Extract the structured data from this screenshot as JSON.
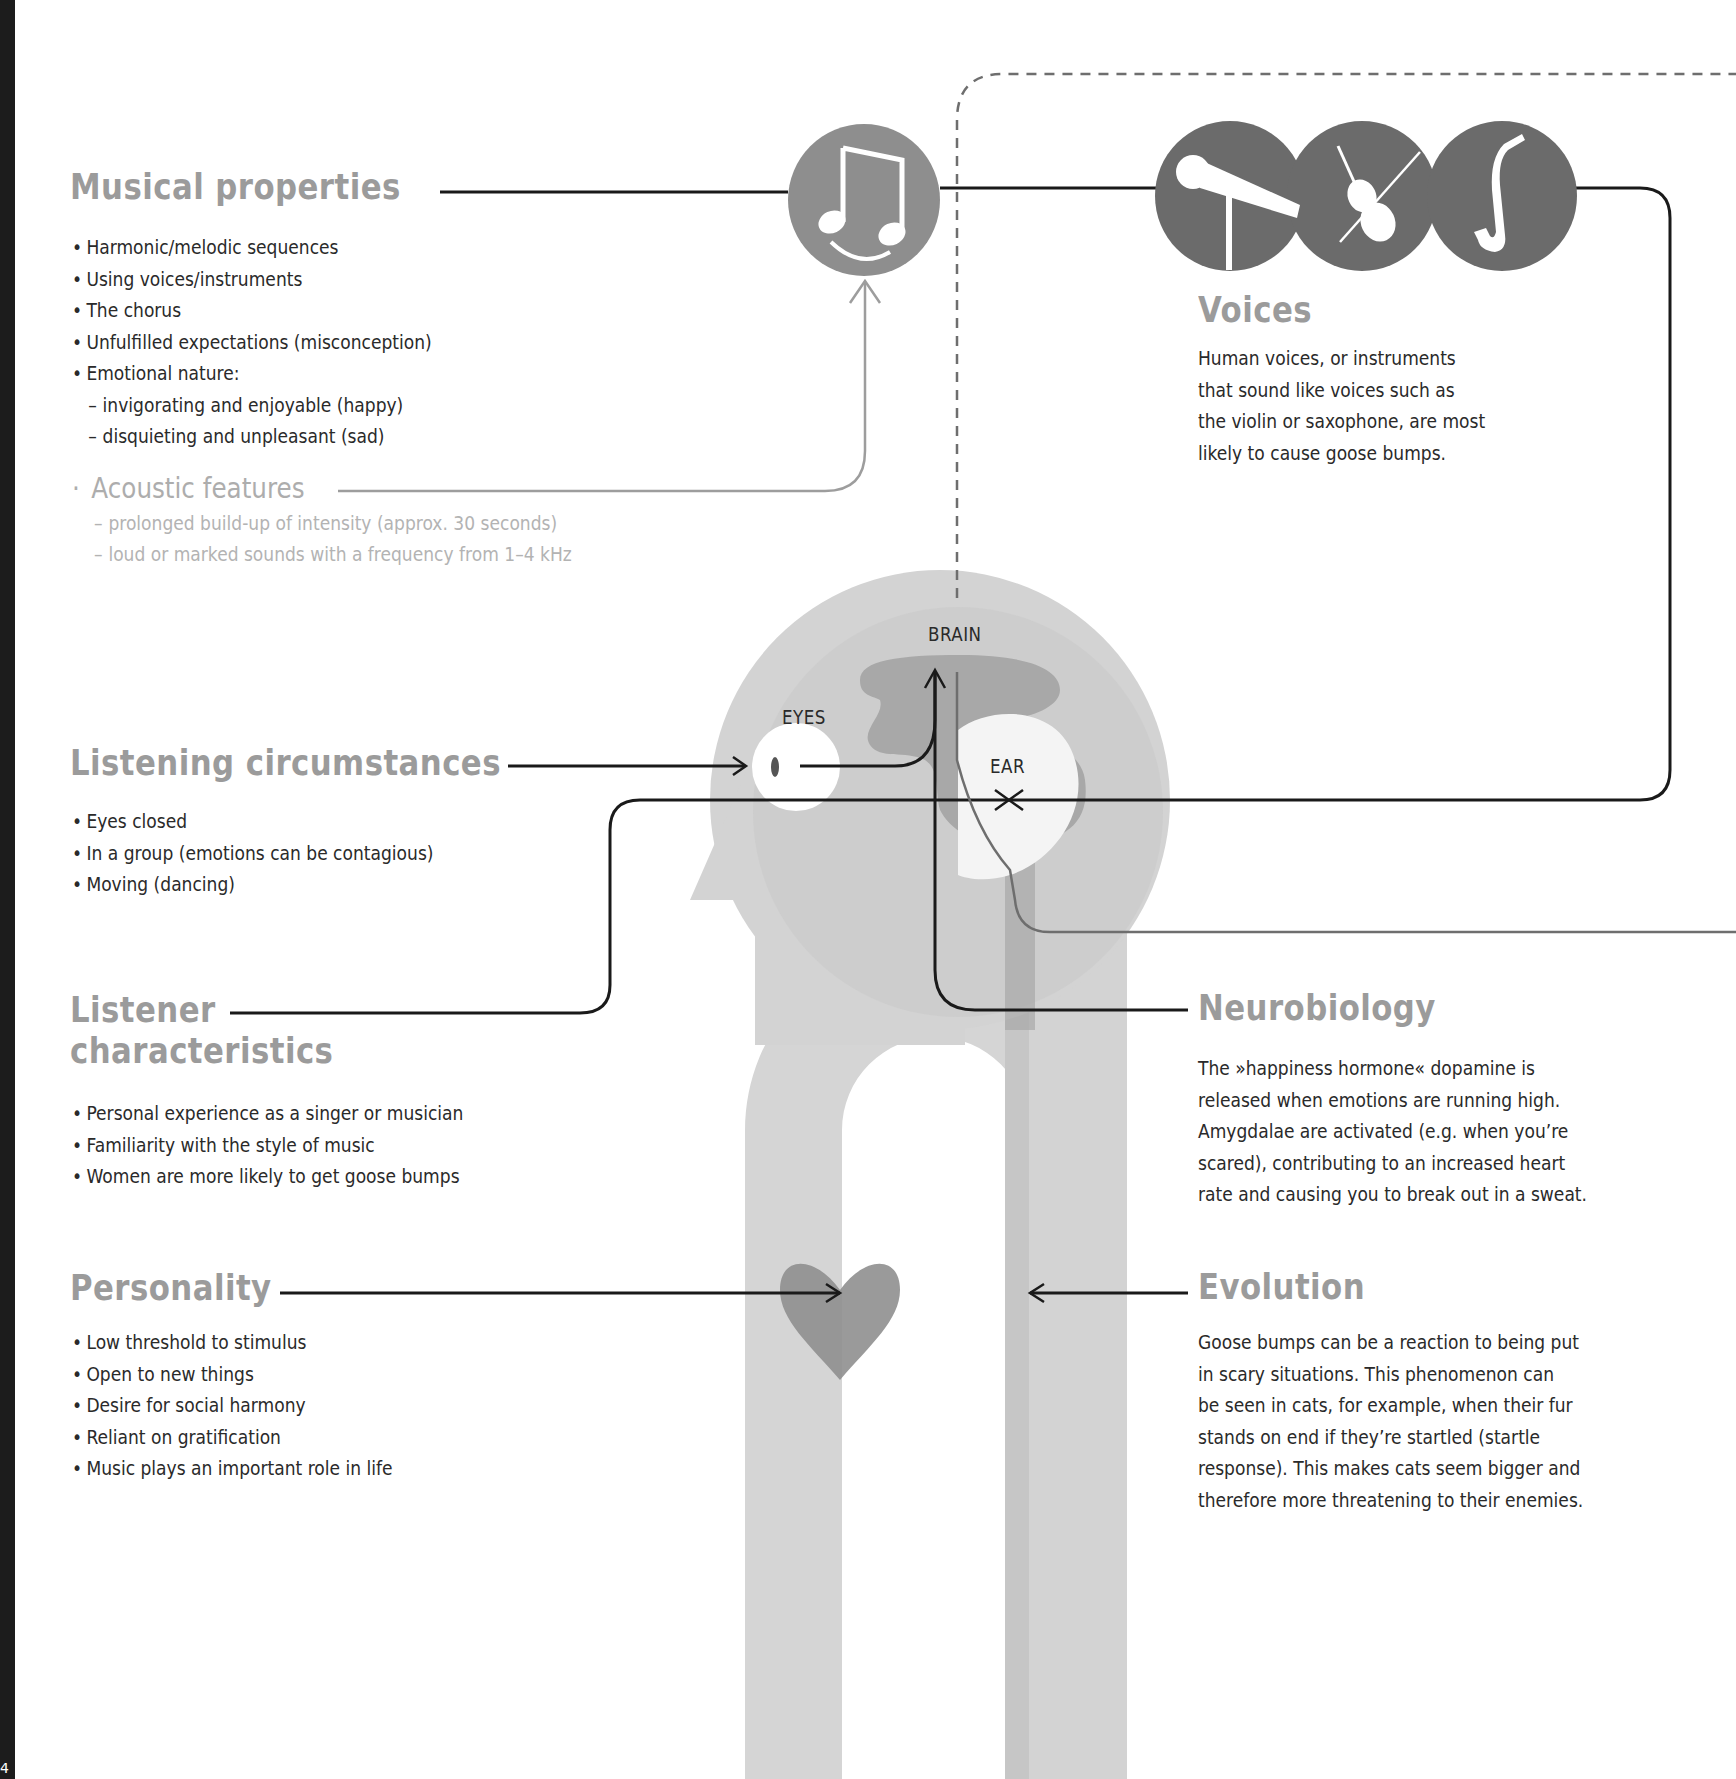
{
  "page": {
    "page_number": "4",
    "colors": {
      "heading_gray": "#9b9b9b",
      "body_text": "#2a2a2a",
      "muted_text": "#b0b0b0",
      "icon_circle_dark": "#6b6b6b",
      "icon_circle_mid": "#8e8e8e",
      "head_light": "#d3d3d3",
      "brain_dark": "#a9a9a9",
      "heart": "#8f8f8f",
      "spine_bar": "#1c1c1c"
    }
  },
  "musical_properties": {
    "title": "Musical properties",
    "items": [
      "Harmonic/melodic sequences",
      "Using voices/instruments",
      "The chorus",
      "Unfulfilled expectations (misconception)",
      "Emotional nature:"
    ],
    "sub_items": [
      "invigorating and enjoyable (happy)",
      "disquieting and unpleasant (sad)"
    ],
    "icon": "smiling-music-note-icon"
  },
  "acoustic_features": {
    "title": "Acoustic features",
    "items": [
      "prolonged build-up of intensity (approx. 30 seconds)",
      "loud or marked sounds with a frequency from 1–4 kHz"
    ]
  },
  "voices": {
    "title": "Voices",
    "lines": [
      "Human voices, or instruments",
      "that sound like voices such as",
      "the violin or saxophone, are most",
      "likely to cause goose bumps."
    ],
    "icons": [
      "microphone-icon",
      "violin-icon",
      "saxophone-icon"
    ]
  },
  "listening_circumstances": {
    "title": "Listening circumstances",
    "items": [
      "Eyes closed",
      "In a group (emotions can be contagious)",
      "Moving (dancing)"
    ]
  },
  "listener_characteristics": {
    "title_line1": "Listener",
    "title_line2": "characteristics",
    "items": [
      "Personal experience as a singer or musician",
      "Familiarity with the style of music",
      "Women are more likely to get goose bumps"
    ]
  },
  "personality": {
    "title": "Personality",
    "items": [
      "Low threshold to stimulus",
      "Open to new things",
      "Desire for social harmony",
      "Reliant on gratification",
      "Music plays an important role in life"
    ]
  },
  "neurobiology": {
    "title": "Neurobiology",
    "lines": [
      "The »happiness hormone« dopamine is",
      "released when emotions are running high.",
      "Amygdalae are activated (e.g. when you’re",
      "scared), contributing to an increased heart",
      "rate and causing you to break out in a sweat."
    ]
  },
  "evolution": {
    "title": "Evolution",
    "lines": [
      "Goose bumps can be a reaction to being put",
      "in scary situations. This phenomenon can",
      "be seen in cats, for example, when their fur",
      "stands on end if they’re startled (startle",
      "response). This makes cats seem bigger and",
      "therefore more threatening to their enemies."
    ]
  },
  "diagram_labels": {
    "brain": "BRAIN",
    "eyes": "EYES",
    "ear": "EAR"
  }
}
